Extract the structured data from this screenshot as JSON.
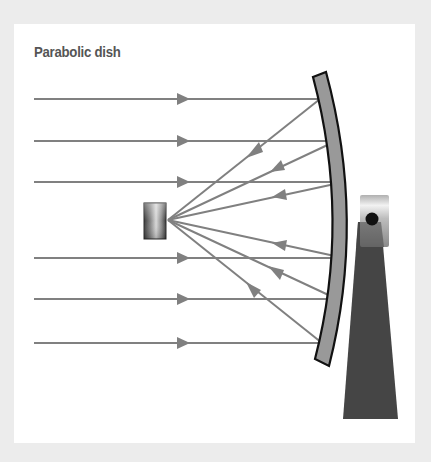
{
  "diagram": {
    "title": "Parabolic dish",
    "colors": {
      "background": "#ececec",
      "panel": "#ffffff",
      "title": "#555555",
      "ray": "#7f7f7f",
      "dish_fill": "#999999",
      "dish_stroke": "#111111",
      "stand": "#444444",
      "mount_dot": "#111111"
    },
    "incoming_rays_y": [
      99,
      141,
      182,
      258,
      299,
      343
    ],
    "focal_point": [
      168,
      220
    ],
    "components": [
      "receiver",
      "parabolic-reflector",
      "mount",
      "stand"
    ]
  }
}
